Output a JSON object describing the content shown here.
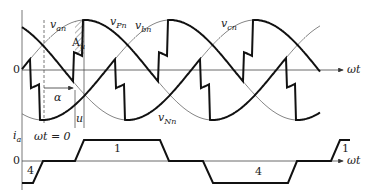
{
  "diagram": {
    "top_plot": {
      "axis_label": "ωt",
      "origin_label": "0",
      "curves": [
        {
          "name": "v_an",
          "label_main": "v",
          "label_sub": "an"
        },
        {
          "name": "v_bn",
          "label_main": "v",
          "label_sub": "bn"
        },
        {
          "name": "v_cn",
          "label_main": "v",
          "label_sub": "cn"
        },
        {
          "name": "v_Pn",
          "label_main": "v",
          "label_sub": "Pn"
        },
        {
          "name": "v_Nn",
          "label_main": "v",
          "label_sub": "Nn"
        }
      ],
      "annotations": {
        "area": {
          "main": "A",
          "sub": "u"
        },
        "alpha": "α",
        "overlap": "u",
        "wt_zero": "ωt = 0"
      }
    },
    "bottom_plot": {
      "y_label_main": "i",
      "y_label_sub": "a",
      "origin_label": "0",
      "axis_label": "ωt",
      "segment_labels": [
        "1",
        "4",
        "4",
        "1"
      ]
    },
    "colors": {
      "thick": "#111111",
      "thin": "#555555",
      "axis": "#444444",
      "hatch": "#666666"
    }
  }
}
